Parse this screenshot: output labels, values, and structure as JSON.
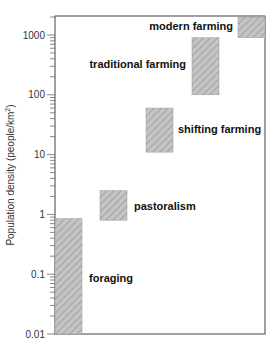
{
  "chart_data": {
    "type": "bar",
    "subtype": "floating-range-bars",
    "title": "",
    "xlabel": "",
    "ylabel": "Population density (people/km²)",
    "yscale": "log",
    "ylim": [
      0.01,
      2000
    ],
    "yticks": [
      "1000",
      "100",
      "10",
      "1",
      "0.1",
      "0.01"
    ],
    "grid": false,
    "categories": [
      "foraging",
      "pastoralism",
      "shifting farming",
      "traditional farming",
      "modern farming"
    ],
    "ranges": [
      {
        "name": "foraging",
        "low": 0.01,
        "high": 0.85
      },
      {
        "name": "pastoralism",
        "low": 0.8,
        "high": 2.5
      },
      {
        "name": "shifting farming",
        "low": 11,
        "high": 60
      },
      {
        "name": "traditional farming",
        "low": 100,
        "high": 900
      },
      {
        "name": "modern farming",
        "low": 900,
        "high": 2000
      }
    ],
    "bar_fill": "#bdbdbd",
    "hatch": "diagonal"
  }
}
